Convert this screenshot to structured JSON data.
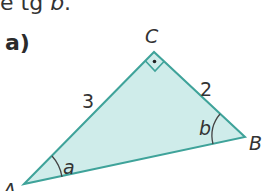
{
  "header": {
    "text_prefix": "e tg ",
    "text_var": "b",
    "text_suffix": "."
  },
  "part": {
    "label": "a)"
  },
  "figure": {
    "type": "right-triangle",
    "fill_color": "#cfecea",
    "stroke_color": "#3fa39a",
    "vertices": {
      "A": {
        "label": "A"
      },
      "B": {
        "label": "B"
      },
      "C": {
        "label": "C"
      }
    },
    "sides": {
      "AC": {
        "label": "3"
      },
      "CB": {
        "label": "2"
      }
    },
    "angles": {
      "at_A": {
        "label": "a"
      },
      "at_B": {
        "label": "b"
      },
      "at_C": {
        "label": "right-angle"
      }
    }
  }
}
